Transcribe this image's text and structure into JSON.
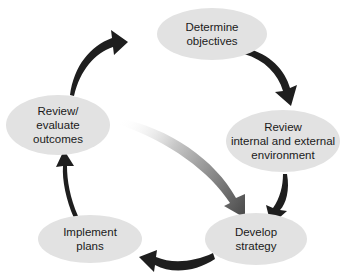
{
  "diagram": {
    "type": "cycle",
    "nodes": [
      {
        "id": "determine",
        "lines": [
          "Determine",
          "objectives"
        ]
      },
      {
        "id": "review_env",
        "lines": [
          "Review",
          "internal and external",
          "environment"
        ]
      },
      {
        "id": "develop",
        "lines": [
          "Develop",
          "strategy"
        ]
      },
      {
        "id": "implement",
        "lines": [
          "Implement",
          "plans"
        ]
      },
      {
        "id": "evaluate",
        "lines": [
          "Review/",
          "evaluate",
          "outcomes"
        ]
      }
    ],
    "edges": [
      {
        "from": "determine",
        "to": "review_env",
        "style": "dark"
      },
      {
        "from": "review_env",
        "to": "develop",
        "style": "dark"
      },
      {
        "from": "develop",
        "to": "implement",
        "style": "dark"
      },
      {
        "from": "implement",
        "to": "evaluate",
        "style": "dark"
      },
      {
        "from": "evaluate",
        "to": "determine",
        "style": "dark"
      },
      {
        "from": "evaluate",
        "to": "develop",
        "style": "gradient"
      }
    ],
    "colors": {
      "node_fill": "#e2e2e2",
      "arrow": "#1e1e1e",
      "text": "#1a1a1a"
    }
  }
}
